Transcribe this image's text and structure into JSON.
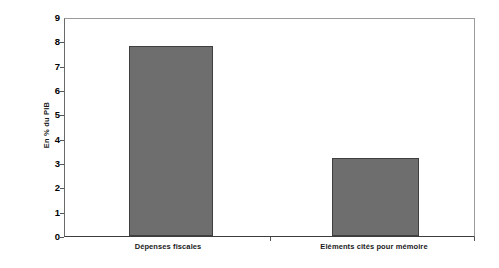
{
  "chart_data": {
    "type": "bar",
    "title": "",
    "xlabel": "",
    "ylabel": "En % du PIB",
    "categories": [
      "Dépenses fiscales",
      "Eléments cités pour mémoire"
    ],
    "values": [
      7.8,
      3.2
    ],
    "ylim": [
      0,
      9
    ],
    "ytick_labels": [
      "0",
      "1",
      "2",
      "3",
      "4",
      "5",
      "6",
      "7",
      "8",
      "9"
    ],
    "ytick_values": [
      0,
      1,
      2,
      3,
      4,
      5,
      6,
      7,
      8,
      9
    ],
    "grid": false,
    "legend": null,
    "bar_color": "#6e6e6e",
    "bar_edge_color": "#3f3f3f",
    "plot_border_color": "#8d8d8d",
    "background_color": "#ffffff"
  }
}
